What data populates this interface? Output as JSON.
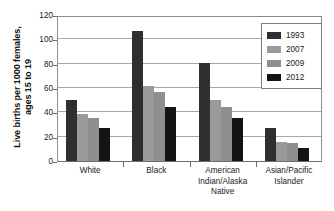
{
  "chart_data": {
    "type": "bar",
    "title": "",
    "xlabel": "",
    "ylabel": "Live births per 1000 females,\nages 15 to 19",
    "ylim": [
      0,
      120
    ],
    "yticks": [
      0,
      20,
      40,
      60,
      80,
      100,
      120
    ],
    "ytick_labels": [
      "0",
      "20",
      "40",
      "60",
      "80",
      "100",
      "120"
    ],
    "grid": true,
    "legend_position": "top-right",
    "categories": [
      "White",
      "Black",
      "American\nIndian/Alaska\nNative",
      "Asian/Pacific\nIslander"
    ],
    "series": [
      {
        "name": "1993",
        "color": "#2f2f2f",
        "values": [
          50.5,
          107.0,
          80.5,
          27.5
        ]
      },
      {
        "name": "2007",
        "color": "#9a9a9a",
        "values": [
          38.5,
          62.0,
          50.0,
          16.0
        ]
      },
      {
        "name": "2009",
        "color": "#8f8f8f",
        "values": [
          35.5,
          57.0,
          44.5,
          14.5
        ]
      },
      {
        "name": "2012",
        "color": "#141414",
        "values": [
          27.5,
          44.0,
          35.5,
          11.0
        ]
      }
    ]
  },
  "legend": {
    "items": [
      {
        "label": "1993"
      },
      {
        "label": "2007"
      },
      {
        "label": "2009"
      },
      {
        "label": "2012"
      }
    ]
  }
}
